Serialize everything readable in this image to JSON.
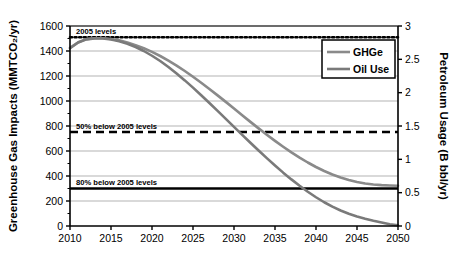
{
  "chart_data": {
    "type": "line",
    "title": "",
    "xlabel": "",
    "ylabel": "Greenhouse Gas Impacts (MMTCO₂/yr)",
    "y2label": "Petroleum Usage (B bbl/yr)",
    "xlim": [
      2010,
      2050
    ],
    "ylim": [
      0,
      1600
    ],
    "y2lim": [
      0,
      3
    ],
    "grid": true,
    "legend_position": "top-right",
    "xticks": [
      2010,
      2015,
      2020,
      2025,
      2030,
      2035,
      2040,
      2045,
      2050
    ],
    "xtick_labels": [
      "2010",
      "2015",
      "2020",
      "2025",
      "2030",
      "2035",
      "2040",
      "2045",
      "2050"
    ],
    "yticks": [
      0,
      200,
      400,
      600,
      800,
      1000,
      1200,
      1400,
      1600
    ],
    "ytick_labels": [
      "0",
      "200",
      "400",
      "600",
      "800",
      "1000",
      "1200",
      "1400",
      "1600"
    ],
    "y2ticks": [
      0,
      0.5,
      1,
      1.5,
      2,
      2.5,
      3
    ],
    "y2tick_labels": [
      "0",
      "0.5",
      "1",
      "1.5",
      "2",
      "2.5",
      "3"
    ],
    "x": [
      2010,
      2011,
      2012,
      2013,
      2014,
      2015,
      2016,
      2017,
      2018,
      2019,
      2020,
      2021,
      2022,
      2023,
      2024,
      2025,
      2026,
      2027,
      2028,
      2029,
      2030,
      2031,
      2032,
      2033,
      2034,
      2035,
      2036,
      2037,
      2038,
      2039,
      2040,
      2041,
      2042,
      2043,
      2044,
      2045,
      2046,
      2047,
      2048,
      2049,
      2050
    ],
    "series": [
      {
        "name": "GHGe",
        "axis": "left",
        "color": "#8a8a8a",
        "values": [
          1425,
          1470,
          1495,
          1502,
          1502,
          1496,
          1485,
          1468,
          1447,
          1422,
          1393,
          1360,
          1323,
          1283,
          1240,
          1194,
          1146,
          1096,
          1045,
          993,
          940,
          886,
          833,
          781,
          730,
          681,
          634,
          589,
          547,
          508,
          472,
          440,
          412,
          388,
          368,
          352,
          340,
          332,
          327,
          324,
          322
        ]
      },
      {
        "name": "Oil Use",
        "axis": "right",
        "color": "#7a7a7a",
        "values": [
          1422,
          1468,
          1493,
          1500,
          1500,
          1492,
          1478,
          1458,
          1432,
          1400,
          1362,
          1320,
          1272,
          1220,
          1165,
          1107,
          1046,
          984,
          921,
          857,
          793,
          729,
          666,
          604,
          543,
          484,
          427,
          373,
          322,
          274,
          230,
          190,
          155,
          124,
          98,
          76,
          58,
          42,
          28,
          14,
          5
        ]
      }
    ],
    "reference_lines": [
      {
        "label": "2005 levels",
        "value": 1510,
        "style": "dotted"
      },
      {
        "label": "50% below 2005 levels",
        "value": 752,
        "style": "dashed"
      },
      {
        "label": "80% below 2005 levels",
        "value": 300,
        "style": "solid"
      }
    ],
    "legend": [
      {
        "label": "GHGe",
        "color": "#8a8a8a"
      },
      {
        "label": "Oil Use",
        "color": "#7a7a7a"
      }
    ]
  }
}
